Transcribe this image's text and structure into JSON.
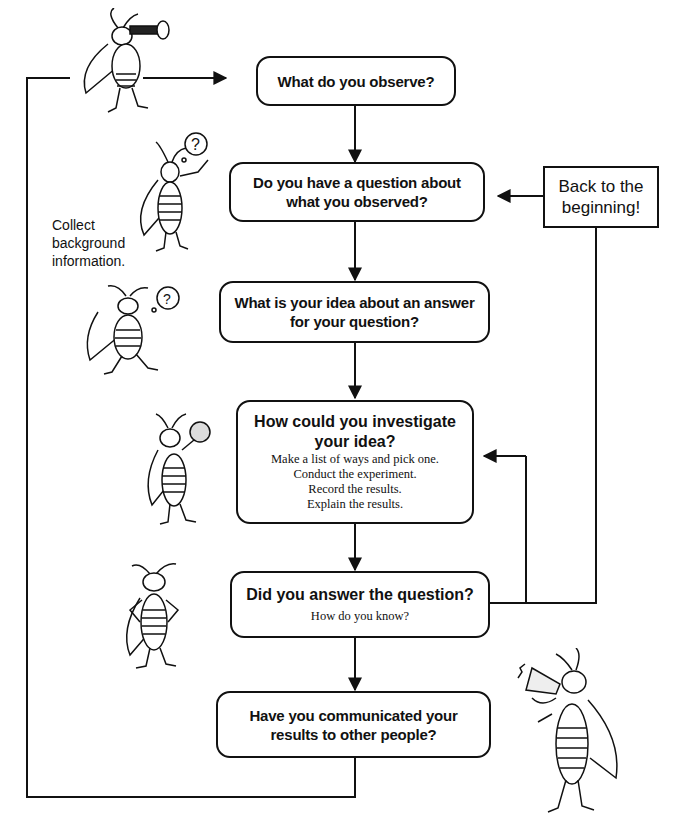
{
  "diagram": {
    "type": "flowchart",
    "steps": [
      {
        "id": "observe",
        "title": "What do you observe?"
      },
      {
        "id": "question",
        "title_lines": [
          "Do you have a question about",
          "what you observed?"
        ]
      },
      {
        "id": "idea",
        "title_lines": [
          "What is your idea about an answer",
          "for your question?"
        ]
      },
      {
        "id": "investigate",
        "title_lines": [
          "How could you investigate",
          "your idea?"
        ],
        "details": [
          "Make a list of ways and pick one.",
          "Conduct the experiment.",
          "Record the results.",
          "Explain the results."
        ]
      },
      {
        "id": "answer",
        "title": "Did you answer the question?",
        "detail": "How do you know?"
      },
      {
        "id": "communicate",
        "title_lines": [
          "Have you communicated your",
          "results to other people?"
        ]
      }
    ],
    "side_box": {
      "lines": [
        "Back to the",
        "beginning!"
      ]
    },
    "side_note": {
      "lines": [
        "Collect",
        "background",
        "information."
      ]
    },
    "illustrations": [
      "cricket-with-telescope-icon",
      "cricket-with-question-bubble-icon",
      "cricket-thinking-icon",
      "cricket-with-magnifier-icon",
      "cricket-hands-on-hips-icon",
      "cricket-with-megaphone-icon"
    ]
  }
}
